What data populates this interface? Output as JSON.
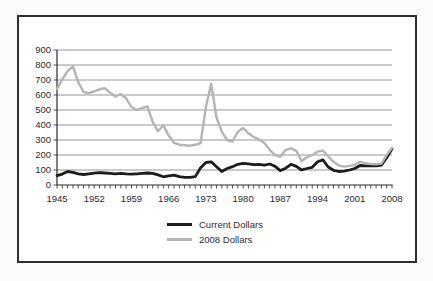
{
  "figure": {
    "background": "#ffffff",
    "border_color": "#2e2e2e"
  },
  "axis": {
    "tick_color": "#2a2a2a",
    "label_color": "#2b2b2b",
    "grid_color": "#8a8a8a",
    "label_font_size": 9.5
  },
  "chart_data": {
    "type": "line",
    "title": "",
    "xlabel": "",
    "ylabel": "",
    "ylim": [
      0,
      900
    ],
    "ytick_step": 100,
    "grid": "horizontal",
    "legend_position": "bottom-center",
    "x": [
      1945,
      1946,
      1947,
      1948,
      1949,
      1950,
      1951,
      1952,
      1953,
      1954,
      1955,
      1956,
      1957,
      1958,
      1959,
      1960,
      1961,
      1962,
      1963,
      1964,
      1965,
      1966,
      1967,
      1968,
      1969,
      1970,
      1971,
      1972,
      1973,
      1974,
      1975,
      1976,
      1977,
      1978,
      1979,
      1980,
      1981,
      1982,
      1983,
      1984,
      1985,
      1986,
      1987,
      1988,
      1989,
      1990,
      1991,
      1992,
      1993,
      1994,
      1995,
      1996,
      1997,
      1998,
      1999,
      2000,
      2001,
      2002,
      2003,
      2004,
      2005,
      2006,
      2007,
      2008
    ],
    "xtick_labels": [
      "1945",
      "1952",
      "1959",
      "1966",
      "1973",
      "1980",
      "1987",
      "1994",
      "2001",
      "2008"
    ],
    "series": [
      {
        "name": "Current Dollars",
        "color": "#1c1c1c",
        "width": 2.8,
        "values": [
          62,
          73,
          90,
          85,
          74,
          70,
          74,
          79,
          82,
          80,
          77,
          74,
          78,
          74,
          72,
          75,
          77,
          80,
          77,
          67,
          55,
          61,
          66,
          56,
          51,
          51,
          56,
          115,
          150,
          155,
          122,
          90,
          110,
          122,
          138,
          145,
          141,
          136,
          138,
          132,
          140,
          125,
          96,
          112,
          138,
          124,
          100,
          110,
          118,
          155,
          167,
          120,
          98,
          90,
          93,
          100,
          110,
          130,
          127,
          127,
          127,
          133,
          182,
          242
        ]
      },
      {
        "name": "2008 Dollars",
        "color": "#b4b4b4",
        "width": 2.4,
        "values": [
          640,
          705,
          760,
          790,
          685,
          620,
          612,
          625,
          638,
          645,
          615,
          590,
          605,
          578,
          520,
          500,
          512,
          525,
          420,
          358,
          398,
          330,
          282,
          268,
          265,
          262,
          268,
          280,
          520,
          675,
          450,
          355,
          300,
          290,
          355,
          380,
          345,
          320,
          303,
          280,
          235,
          200,
          188,
          235,
          245,
          228,
          158,
          185,
          200,
          222,
          230,
          190,
          155,
          130,
          123,
          127,
          133,
          155,
          145,
          140,
          139,
          143,
          200,
          248
        ]
      }
    ]
  }
}
